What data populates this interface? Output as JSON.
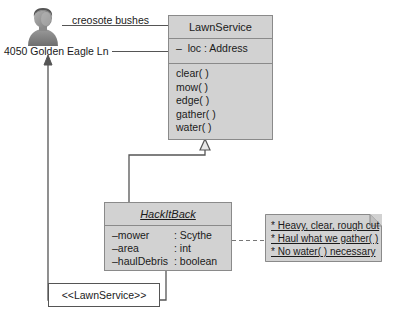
{
  "diagram": {
    "type": "uml-class-diagram",
    "background": "#ffffff",
    "fill_color": "#d2d2d2",
    "border_color": "#8a8a8a",
    "text_color": "#1a1a1a"
  },
  "actor": {
    "icon": "person-bust-icon",
    "address_label": "4050 Golden Eagle Ln",
    "association_label": "creosote bushes"
  },
  "classes": [
    {
      "id": "lawnservice",
      "name": "LawnService",
      "italic": false,
      "attributes": [
        {
          "text": "–  loc : Address"
        }
      ],
      "operations": [
        "clear( )",
        "mow( )",
        "edge( )",
        "gather( )",
        "water( )"
      ]
    },
    {
      "id": "hackitback",
      "name": "HackItBack",
      "italic": true,
      "attributes": [
        {
          "name": "–mower",
          "type": ": Scythe"
        },
        {
          "name": "–area",
          "type": ": int"
        },
        {
          "name": "–haulDebris",
          "type": ": boolean"
        }
      ],
      "operations": []
    }
  ],
  "note": {
    "lines": [
      "* Heavy, clear, rough cut",
      "* Haul what we gather( )",
      "* No water( ) necessary"
    ]
  },
  "stereotype": {
    "label": "<<LawnService>>"
  },
  "connectors": [
    {
      "name": "actor-to-lawnservice-association",
      "style": "solid",
      "label": "creosote bushes"
    },
    {
      "name": "address-to-loc-association",
      "style": "solid"
    },
    {
      "name": "hackitback-generalization",
      "style": "solid",
      "arrow": "hollow-triangle"
    },
    {
      "name": "hackitback-to-note-anchor",
      "style": "dashed"
    },
    {
      "name": "hackitback-to-actor-dependency",
      "style": "solid",
      "arrow": "open-arrow",
      "label": "<<LawnService>>"
    }
  ]
}
